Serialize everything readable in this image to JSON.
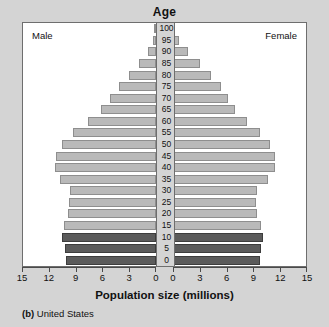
{
  "chart_data": {
    "type": "bar",
    "subtype": "population-pyramid",
    "title": "Age",
    "xlabel": "Population size (millions)",
    "ylabel": "Age",
    "caption_prefix": "(b)",
    "caption": "United States",
    "left_panel_label": "Male",
    "right_panel_label": "Female",
    "categories": [
      "0",
      "5",
      "10",
      "15",
      "20",
      "25",
      "30",
      "35",
      "40",
      "45",
      "50",
      "55",
      "60",
      "65",
      "70",
      "75",
      "80",
      "85",
      "90",
      "95",
      "100"
    ],
    "age_tick_labels": [
      "100",
      "95",
      "90",
      "85",
      "80",
      "75",
      "70",
      "65",
      "60",
      "55",
      "50",
      "45",
      "40",
      "35",
      "30",
      "25",
      "20",
      "15",
      "10",
      "5",
      "0"
    ],
    "xtick_labels_left": [
      "15",
      "12",
      "9",
      "6",
      "3",
      "0"
    ],
    "xtick_labels_right": [
      "0",
      "3",
      "6",
      "9",
      "12",
      "15"
    ],
    "xlim": [
      0,
      15
    ],
    "xtick_values": [
      0,
      3,
      6,
      9,
      12,
      15
    ],
    "grid": false,
    "legend": "none",
    "colors": {
      "bar_light": "#b9b9b9",
      "bar_dark": "#5b5b5b",
      "bar_light_edge": "#8e8e8e",
      "bar_dark_edge": "#3d3d3d",
      "background": "#d4d4d4",
      "plot_background": "#ffffff",
      "axis": "#4a4a4a"
    },
    "highlighted_categories": [
      "0",
      "5",
      "10"
    ],
    "series": [
      {
        "name": "Male",
        "side": "left",
        "values": [
          10.2,
          10.3,
          10.6,
          10.4,
          9.9,
          9.8,
          9.7,
          10.8,
          11.4,
          11.3,
          10.6,
          9.4,
          7.7,
          6.2,
          5.2,
          4.2,
          3.0,
          1.9,
          0.9,
          0.3,
          0.1
        ]
      },
      {
        "name": "Female",
        "side": "right",
        "values": [
          9.8,
          9.9,
          10.1,
          9.9,
          9.5,
          9.4,
          9.5,
          10.7,
          11.5,
          11.5,
          10.9,
          9.8,
          8.3,
          7.0,
          6.2,
          5.4,
          4.3,
          3.1,
          1.7,
          0.7,
          0.2
        ]
      }
    ]
  }
}
